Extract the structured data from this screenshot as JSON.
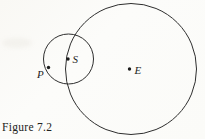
{
  "figure": {
    "caption": "Figure 7.2",
    "stroke_color": "#2e2e2e",
    "dot_color": "#1c1c1c",
    "background_color": "#fbfaf7",
    "large_circle": {
      "cx": 131,
      "cy": 69,
      "r": 65.5,
      "center_point": "E"
    },
    "small_circle": {
      "cx": 68.5,
      "cy": 59,
      "r": 25,
      "center_point": "S"
    },
    "dot_radius": 1.7,
    "points": [
      {
        "label": "P",
        "dot": {
          "x": 48.5,
          "y": 67.5
        },
        "label_pos": {
          "x": 37,
          "y": 77.5
        }
      },
      {
        "label": "S",
        "dot": {
          "x": 68,
          "y": 59
        },
        "label_pos": {
          "x": 72.5,
          "y": 63
        }
      },
      {
        "label": "E",
        "dot": {
          "x": 129.5,
          "y": 69
        },
        "label_pos": {
          "x": 134.5,
          "y": 73.5
        }
      }
    ]
  }
}
